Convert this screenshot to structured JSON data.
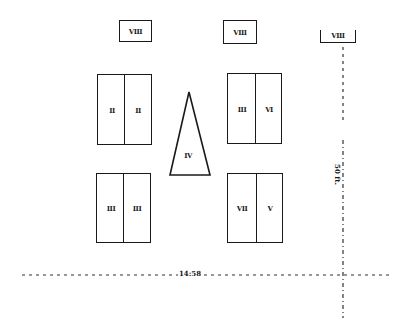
{
  "diagram": {
    "type": "site-plan",
    "small_blocks": [
      {
        "id": "block-viii-left",
        "label": "VIII"
      },
      {
        "id": "block-viii-center",
        "label": "VIII"
      },
      {
        "id": "block-viii-right",
        "label": "VIII"
      }
    ],
    "double_blocks": [
      {
        "id": "top-left",
        "left_label": "II",
        "right_label": "II"
      },
      {
        "id": "top-right",
        "left_label": "III",
        "right_label": "VI"
      },
      {
        "id": "bottom-left",
        "left_label": "III",
        "right_label": "III"
      },
      {
        "id": "bottom-right",
        "left_label": "VII",
        "right_label": "V"
      }
    ],
    "triangle": {
      "label": "IV"
    },
    "dimensions": {
      "horizontal": "14:58",
      "vertical": "50 ft."
    }
  }
}
